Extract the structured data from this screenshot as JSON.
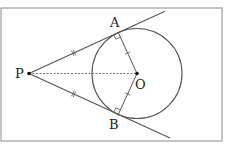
{
  "diagram": {
    "colors": {
      "frame": "#8a8a8a",
      "line": "#555555",
      "circle": "#555555",
      "dashed": "#777777",
      "point": "#111111",
      "label": "#222222"
    },
    "frame": {
      "x": 1,
      "y": 8,
      "w": 221,
      "h": 133
    },
    "circle": {
      "cx": 137,
      "cy": 73.5,
      "r": 45
    },
    "points": {
      "P": {
        "label": "P",
        "x": 29,
        "y": 73.5,
        "lx": 15,
        "ly": 78
      },
      "A": {
        "label": "A",
        "x": 118.3,
        "y": 32.6,
        "lx": 110,
        "ly": 27
      },
      "B": {
        "label": "B",
        "x": 118.3,
        "y": 114.4,
        "lx": 109,
        "ly": 129
      },
      "O": {
        "label": "O",
        "x": 137,
        "y": 73.5,
        "lx": 135,
        "ly": 89
      }
    },
    "tangent_lines": [
      {
        "name": "tangent-PA",
        "x1": 29,
        "y1": 73.5,
        "x2": 165,
        "y2": 11.2
      },
      {
        "name": "tangent-PB",
        "x1": 29,
        "y1": 73.5,
        "x2": 170,
        "y2": 138.1
      }
    ],
    "radii": [
      {
        "name": "radius-OA",
        "x1": 137,
        "y1": 73.5,
        "x2": 118.3,
        "y2": 32.6
      },
      {
        "name": "radius-OB",
        "x1": 137,
        "y1": 73.5,
        "x2": 118.3,
        "y2": 114.4
      }
    ],
    "dashed_segment": {
      "name": "segment-PO",
      "x1": 29,
      "y1": 73.5,
      "x2": 137,
      "y2": 73.5
    },
    "equal_marks": {
      "PA": "double tick",
      "PB": "double tick",
      "OA": "single tick",
      "OB": "single tick"
    },
    "right_angles": [
      "A",
      "B"
    ]
  }
}
